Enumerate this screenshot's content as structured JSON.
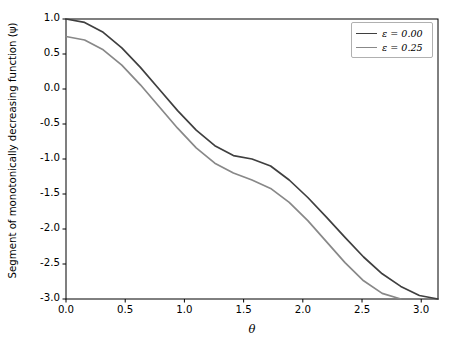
{
  "chart_data": {
    "type": "line",
    "title": "",
    "xlabel": "θ",
    "ylabel": "Segment of monotonically decreasing function (ψ)",
    "xlim": [
      0.0,
      3.1416
    ],
    "ylim": [
      -3.0,
      1.0
    ],
    "xticks": [
      "0.0",
      "0.5",
      "1.0",
      "1.5",
      "2.0",
      "2.5",
      "3.0"
    ],
    "xtick_values": [
      0.0,
      0.5,
      1.0,
      1.5,
      2.0,
      2.5,
      3.0
    ],
    "yticks": [
      "1.0",
      "0.5",
      "0.0",
      "-0.5",
      "-1.0",
      "-1.5",
      "-2.0",
      "-2.5",
      "-3.0"
    ],
    "ytick_values": [
      1.0,
      0.5,
      0.0,
      -0.5,
      -1.0,
      -1.5,
      -2.0,
      -2.5,
      -3.0
    ],
    "grid": false,
    "legend_position": "upper right",
    "series": [
      {
        "name": "ε = 0.00",
        "color": "#3f3f3f",
        "x": [
          0.0,
          0.1571,
          0.3142,
          0.4712,
          0.6283,
          0.7854,
          0.9425,
          1.0996,
          1.2566,
          1.4137,
          1.5708,
          1.7279,
          1.885,
          2.042,
          2.1991,
          2.3562,
          2.5133,
          2.6704,
          2.8274,
          2.9845,
          3.1416
        ],
        "y": [
          1.0,
          0.9507,
          0.809,
          0.5878,
          0.309,
          0.0,
          -0.309,
          -0.5878,
          -0.809,
          -0.9507,
          -1.0,
          -1.1,
          -1.3,
          -1.55,
          -1.83,
          -2.12,
          -2.4,
          -2.64,
          -2.82,
          -2.95,
          -3.0
        ]
      },
      {
        "name": "ε = 0.25",
        "color": "#888888",
        "x": [
          0.0,
          0.1571,
          0.3142,
          0.4712,
          0.6283,
          0.7854,
          0.9425,
          1.0996,
          1.2566,
          1.4137,
          1.5708,
          1.7279,
          1.885,
          2.042,
          2.1991,
          2.3562,
          2.5133,
          2.6704,
          2.8274
        ],
        "y": [
          0.75,
          0.7,
          0.56,
          0.34,
          0.06,
          -0.25,
          -0.56,
          -0.84,
          -1.06,
          -1.2,
          -1.3,
          -1.42,
          -1.62,
          -1.88,
          -2.18,
          -2.48,
          -2.74,
          -2.92,
          -3.0
        ]
      }
    ]
  },
  "axes": {
    "spine_color": "#000000",
    "background": "#ffffff"
  }
}
